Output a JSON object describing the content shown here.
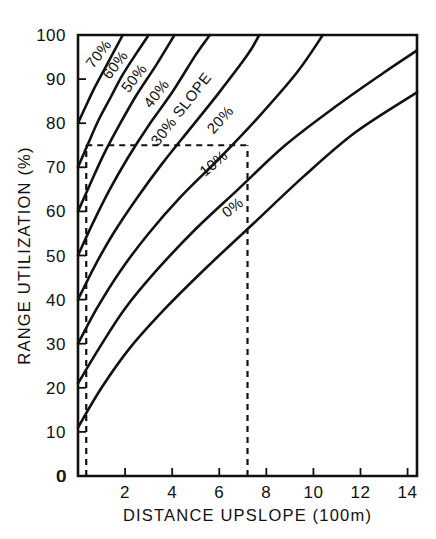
{
  "chart_data": {
    "type": "line",
    "title": "",
    "xlabel": "DISTANCE  UPSLOPE  (100m)",
    "ylabel": "RANGE  UTILIZATION  (%)",
    "xlim": [
      0,
      14.4
    ],
    "ylim": [
      0,
      100
    ],
    "xticks": [
      0,
      2,
      4,
      6,
      8,
      10,
      12,
      14
    ],
    "xtick_labels": [
      "0",
      "2",
      "4",
      "6",
      "8",
      "10",
      "12",
      "14"
    ],
    "yticks": [
      0,
      10,
      20,
      30,
      40,
      50,
      60,
      70,
      80,
      90,
      100
    ],
    "ytick_labels": [
      "0",
      "10",
      "20",
      "30",
      "40",
      "50",
      "60",
      "70",
      "80",
      "90",
      "100"
    ],
    "grid": false,
    "legend_position": "inline-curve-labels",
    "series": [
      {
        "name": "70%",
        "label": "70%",
        "label_x": 1.05,
        "label_y": 95.0,
        "label_rotation": -52,
        "x": [
          0.0,
          0.3,
          0.7,
          1.1,
          1.5,
          1.9
        ],
        "y": [
          80.0,
          83.5,
          88.0,
          92.0,
          96.0,
          100.0
        ]
      },
      {
        "name": "60%",
        "label": "60%",
        "label_x": 1.75,
        "label_y": 92.5,
        "label_rotation": -52,
        "x": [
          0.0,
          0.4,
          0.9,
          1.4,
          1.9,
          2.5,
          3.0
        ],
        "y": [
          70.0,
          75.0,
          81.0,
          86.0,
          91.0,
          96.0,
          100.0
        ]
      },
      {
        "name": "50%",
        "label": "50%",
        "label_x": 2.55,
        "label_y": 89.5,
        "label_rotation": -52,
        "x": [
          0.0,
          0.5,
          1.1,
          1.8,
          2.5,
          3.3,
          4.1
        ],
        "y": [
          60.0,
          66.0,
          73.0,
          80.0,
          86.5,
          93.0,
          100.0
        ]
      },
      {
        "name": "40%",
        "label": "40%",
        "label_x": 3.5,
        "label_y": 86.0,
        "label_rotation": -52,
        "x": [
          0.0,
          0.6,
          1.3,
          2.1,
          3.0,
          4.0,
          5.0,
          5.6
        ],
        "y": [
          50.0,
          57.0,
          64.5,
          72.0,
          79.5,
          87.0,
          95.5,
          100.0
        ]
      },
      {
        "name": "30% SLOPE",
        "label": "30%  SLOPE",
        "label_x": 4.55,
        "label_y": 82.5,
        "label_rotation": -52,
        "x": [
          0.0,
          0.7,
          1.5,
          2.5,
          3.6,
          4.8,
          6.0,
          7.2,
          7.7
        ],
        "y": [
          40.0,
          47.5,
          55.0,
          63.0,
          71.0,
          79.0,
          87.0,
          95.5,
          100.0
        ]
      },
      {
        "name": "20%",
        "label": "20%",
        "label_x": 6.2,
        "label_y": 80.0,
        "label_rotation": -48,
        "x": [
          0.0,
          0.8,
          1.8,
          3.0,
          4.4,
          6.0,
          7.6,
          9.3,
          10.4
        ],
        "y": [
          30.0,
          38.0,
          46.5,
          55.0,
          63.5,
          72.0,
          81.0,
          91.5,
          100.0
        ]
      },
      {
        "name": "10%",
        "label": "10%",
        "label_x": 5.9,
        "label_y": 70.0,
        "label_rotation": -40,
        "x": [
          0.0,
          0.9,
          2.0,
          3.4,
          5.0,
          6.8,
          8.8,
          11.0,
          13.0,
          14.4
        ],
        "y": [
          21.0,
          29.0,
          38.0,
          47.0,
          56.0,
          65.0,
          75.0,
          84.0,
          91.5,
          96.5
        ]
      },
      {
        "name": "0%",
        "label": "0%",
        "label_x": 6.7,
        "label_y": 60.0,
        "label_rotation": -38,
        "x": [
          0.0,
          1.0,
          2.2,
          3.8,
          5.6,
          7.5,
          9.6,
          11.8,
          14.4
        ],
        "y": [
          11.0,
          20.0,
          29.0,
          38.5,
          48.0,
          57.5,
          68.0,
          78.0,
          87.0
        ]
      }
    ],
    "annotations": [
      {
        "name": "horizontal-reference-line",
        "type": "dashed-horizontal",
        "y": 75.0,
        "x_start": 0.35,
        "x_end": 7.2
      },
      {
        "name": "vertical-reference-line-left",
        "type": "dashed-vertical",
        "x": 0.35,
        "y_start": 0.0,
        "y_end": 75.0
      },
      {
        "name": "vertical-reference-line-right",
        "type": "dashed-vertical",
        "x": 7.2,
        "y_start": 0.0,
        "y_end": 75.0
      }
    ]
  }
}
